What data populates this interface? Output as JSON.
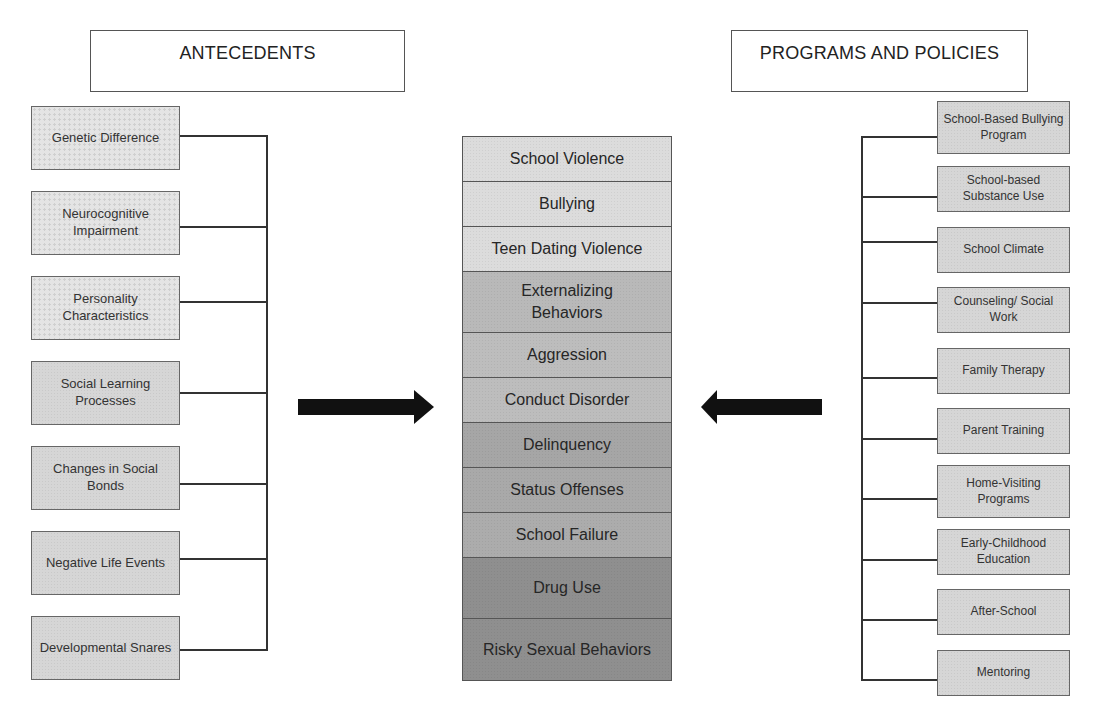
{
  "headers": {
    "left": "ANTECEDENTS",
    "right": "PROGRAMS AND POLICIES"
  },
  "antecedents": [
    {
      "label": "Genetic Difference",
      "style": "dotted"
    },
    {
      "label": "Neurocognitive Impairment",
      "style": "dotted"
    },
    {
      "label": "Personality Characteristics",
      "style": "dotted"
    },
    {
      "label": "Social Learning Processes",
      "style": "plain"
    },
    {
      "label": "Changes in Social Bonds",
      "style": "plain"
    },
    {
      "label": "Negative Life Events",
      "style": "plain"
    },
    {
      "label": "Developmental Snares",
      "style": "plain"
    }
  ],
  "outcomes": [
    {
      "label": "School Violence",
      "color": "#dcdcdc"
    },
    {
      "label": "Bullying",
      "color": "#dcdcdc"
    },
    {
      "label": "Teen Dating Violence",
      "color": "#dcdcdc"
    },
    {
      "label": "Externalizing Behaviors",
      "color": "#b9b9b9"
    },
    {
      "label": "Aggression",
      "color": "#bdbdbd"
    },
    {
      "label": "Conduct Disorder",
      "color": "#bdbdbd"
    },
    {
      "label": "Delinquency",
      "color": "#a6a6a6"
    },
    {
      "label": "Status Offenses",
      "color": "#a9a9a9"
    },
    {
      "label": "School Failure",
      "color": "#acacac"
    },
    {
      "label": "Drug Use",
      "color": "#8f8f8f"
    },
    {
      "label": "Risky Sexual Behaviors",
      "color": "#8f8f8f"
    }
  ],
  "programs": [
    {
      "label": "School-Based Bullying Program"
    },
    {
      "label": "School-based Substance Use"
    },
    {
      "label": "School Climate"
    },
    {
      "label": "Counseling/ Social Work"
    },
    {
      "label": "Family Therapy"
    },
    {
      "label": "Parent Training"
    },
    {
      "label": "Home-Visiting Programs"
    },
    {
      "label": "Early-Childhood Education"
    },
    {
      "label": "After-School"
    },
    {
      "label": "Mentoring"
    }
  ],
  "arrows": {
    "left": {
      "direction": "right",
      "icon": "right-arrow-icon"
    },
    "right": {
      "direction": "left",
      "icon": "left-arrow-icon"
    }
  }
}
